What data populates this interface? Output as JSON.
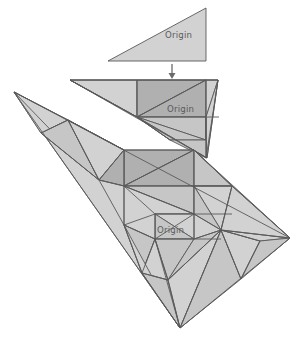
{
  "figure": {
    "background_color": "#ffffff",
    "stroke_color": "#595959",
    "fill_light": "#d2d2d2",
    "fill_mid": "#c6c6c6",
    "fill_dark": "#b0b0b0",
    "label_color": "#5a5a5a",
    "arrow_color": "#6b6b6b",
    "width": 306,
    "height": 339
  },
  "labels": {
    "origin_1": "Origin",
    "origin_2": "Origin",
    "origin_3": "Origin"
  },
  "generations": [
    {
      "name": "generation-1",
      "label": "Origin",
      "subdivision_count": 1,
      "description": "Plain right triangle, right angle at lower right"
    },
    {
      "name": "generation-2",
      "label": "Origin",
      "subdivision_count": 6,
      "description": "Triangle reflected and subdivided once; seed triangle shaded dark"
    },
    {
      "name": "generation-3",
      "label": "Origin",
      "subdivision_count": 24,
      "description": "Triangle reflected and subdivided twice; seed triangle shaded dark"
    }
  ],
  "arrows": [
    {
      "name": "arrow-gen1-to-gen2",
      "direction": "down"
    },
    {
      "name": "arrow-gen2-to-gen3",
      "direction": "down"
    }
  ]
}
